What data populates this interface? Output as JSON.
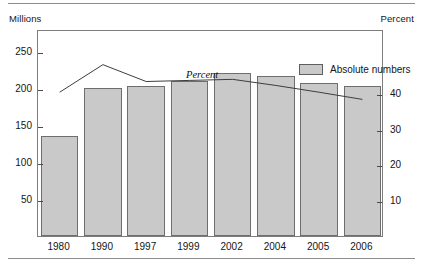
{
  "figure": {
    "left_axis_unit": "Millions",
    "right_axis_unit": "Percent",
    "series_annotation": "Percent",
    "legend": [
      {
        "label": "Absolute numbers",
        "swatch_color": "#c9c9c9"
      }
    ]
  },
  "chart_data": {
    "type": "bar",
    "title": "",
    "xlabel": "",
    "ylabel": "Millions",
    "y2label": "Percent",
    "categories": [
      "1980",
      "1990",
      "1997",
      "1999",
      "2002",
      "2004",
      "2005",
      "2006"
    ],
    "ylim": [
      0,
      280
    ],
    "y2lim": [
      0,
      57.8
    ],
    "yticks": [
      50,
      100,
      150,
      200,
      250
    ],
    "ytick_labels": [
      "50",
      "100",
      "150",
      "200",
      "250"
    ],
    "y2ticks": [
      10,
      20,
      30,
      40
    ],
    "y2tick_labels": [
      "10",
      "20",
      "30",
      "40"
    ],
    "grid": false,
    "legend_position": "top-right",
    "series": [
      {
        "name": "Absolute numbers",
        "type": "bar",
        "axis": "left",
        "unit": "Millions",
        "color": "#c9c9c9",
        "edge_color": "#6e6e6e",
        "values": [
          135,
          200,
          203,
          210,
          220,
          216,
          207,
          203
        ]
      },
      {
        "name": "Percent",
        "type": "line",
        "axis": "right",
        "unit": "Percent",
        "color": "#3d3d3d",
        "values": [
          40.7,
          48.4,
          43.7,
          44.0,
          44.3,
          42.6,
          40.7,
          38.7
        ]
      }
    ]
  }
}
